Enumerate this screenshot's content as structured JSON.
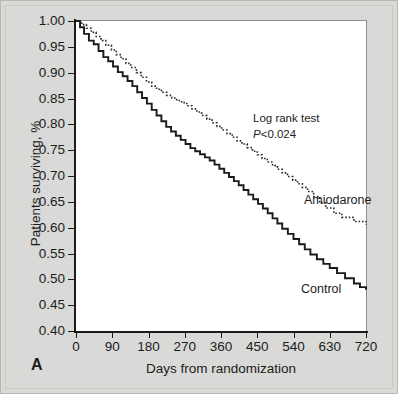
{
  "figure": {
    "panel_label": "A",
    "background_color": "#d9d9d7",
    "plot_background_color": "#ffffff"
  },
  "annotations": {
    "logrank_label": "Log rank test",
    "pvalue_italic": "P",
    "pvalue_rest": "<0.024",
    "series_label_amiodarone": "Amiodarone",
    "series_label_control": "Control"
  },
  "chart_data": {
    "type": "line",
    "title": "",
    "subtitle": "",
    "xlabel": "Days from randomization",
    "ylabel": "Patients surviving, %",
    "xlim": [
      0,
      720
    ],
    "ylim": [
      0.4,
      1.0
    ],
    "xticks": [
      0,
      90,
      180,
      270,
      360,
      450,
      540,
      630,
      720
    ],
    "xticklabels": [
      "0",
      "90",
      "180",
      "270",
      "360",
      "450",
      "540",
      "630",
      "720"
    ],
    "yticks": [
      0.4,
      0.45,
      0.5,
      0.55,
      0.6,
      0.65,
      0.7,
      0.75,
      0.8,
      0.85,
      0.9,
      0.95,
      1.0
    ],
    "yticklabels": [
      "0.40",
      "0.45",
      "0.50",
      "0.55",
      "0.60",
      "0.65",
      "0.70",
      "0.75",
      "0.80",
      "0.85",
      "0.90",
      "0.95",
      "1.00"
    ],
    "grid": false,
    "legend_position": "inline-curve-labels",
    "step_type": "post",
    "statistical_test": "Log rank test",
    "p_value_text": "P<0.024",
    "series": [
      {
        "name": "Amiodarone",
        "linestyle": "dotted",
        "color": "#2a2a2a",
        "label_position": {
          "x": 600,
          "y": 0.635
        },
        "x": [
          0,
          14,
          26,
          38,
          50,
          62,
          74,
          88,
          100,
          112,
          124,
          136,
          150,
          162,
          175,
          188,
          200,
          212,
          225,
          238,
          250,
          262,
          275,
          288,
          300,
          312,
          325,
          338,
          350,
          362,
          375,
          388,
          400,
          412,
          425,
          438,
          450,
          462,
          475,
          488,
          500,
          512,
          525,
          538,
          550,
          562,
          575,
          590,
          605,
          620,
          640,
          660,
          690,
          720
        ],
        "y": [
          1.0,
          0.993,
          0.986,
          0.978,
          0.97,
          0.962,
          0.953,
          0.944,
          0.935,
          0.927,
          0.918,
          0.91,
          0.9,
          0.891,
          0.882,
          0.874,
          0.868,
          0.862,
          0.856,
          0.851,
          0.846,
          0.842,
          0.836,
          0.83,
          0.824,
          0.817,
          0.81,
          0.803,
          0.796,
          0.789,
          0.782,
          0.775,
          0.768,
          0.762,
          0.755,
          0.748,
          0.741,
          0.734,
          0.727,
          0.72,
          0.713,
          0.706,
          0.699,
          0.692,
          0.685,
          0.678,
          0.67,
          0.66,
          0.648,
          0.638,
          0.628,
          0.62,
          0.612,
          0.605
        ]
      },
      {
        "name": "Control",
        "linestyle": "solid",
        "color": "#1a1a1a",
        "label_position": {
          "x": 610,
          "y": 0.455
        },
        "x": [
          0,
          10,
          20,
          32,
          44,
          56,
          68,
          80,
          92,
          104,
          116,
          128,
          140,
          152,
          164,
          176,
          188,
          200,
          212,
          224,
          236,
          248,
          260,
          272,
          284,
          296,
          308,
          320,
          332,
          344,
          356,
          368,
          380,
          392,
          404,
          416,
          428,
          440,
          452,
          464,
          476,
          488,
          500,
          512,
          526,
          540,
          554,
          568,
          582,
          598,
          614,
          630,
          648,
          668,
          690,
          705,
          720
        ],
        "y": [
          1.0,
          0.988,
          0.975,
          0.962,
          0.955,
          0.942,
          0.93,
          0.922,
          0.912,
          0.901,
          0.893,
          0.884,
          0.874,
          0.862,
          0.851,
          0.84,
          0.828,
          0.817,
          0.806,
          0.795,
          0.786,
          0.778,
          0.77,
          0.762,
          0.754,
          0.748,
          0.742,
          0.736,
          0.73,
          0.722,
          0.714,
          0.706,
          0.698,
          0.69,
          0.682,
          0.673,
          0.664,
          0.655,
          0.646,
          0.637,
          0.628,
          0.618,
          0.608,
          0.598,
          0.588,
          0.578,
          0.568,
          0.558,
          0.548,
          0.539,
          0.53,
          0.522,
          0.512,
          0.502,
          0.492,
          0.485,
          0.48
        ]
      }
    ]
  }
}
